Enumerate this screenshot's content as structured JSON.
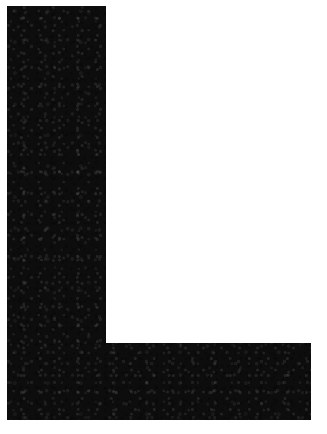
{
  "image": {
    "subject": "L",
    "description": "Capital letter L",
    "width": 327,
    "height": 434,
    "background_color": "#ffffff",
    "ink_color": "#0d0d0d",
    "texture": "scanned print grain"
  },
  "glyph": {
    "character": "L",
    "name": "letter-l",
    "fill": "#0d0d0d",
    "path": "M 7 6 L 106 6 L 106 343 L 311 343 L 311 420 L 7 420 Z",
    "bounds": {
      "left": 7,
      "top": 6,
      "right": 311,
      "bottom": 420
    },
    "stem": {
      "left": 7,
      "top": 6,
      "right": 106,
      "bottom": 420,
      "width": 99,
      "height": 414
    },
    "foot": {
      "left": 7,
      "top": 343,
      "right": 311,
      "bottom": 420,
      "width": 304,
      "height": 77
    }
  }
}
